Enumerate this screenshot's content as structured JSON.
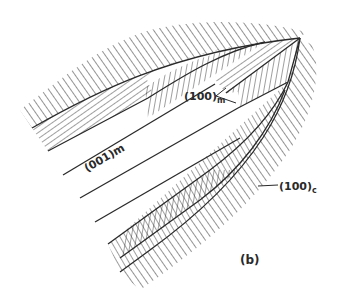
{
  "figure": {
    "panel_label": "(b)",
    "labels": {
      "matrix_100": {
        "main": "(100)",
        "sub": "m"
      },
      "matrix_001": {
        "main": "(001)",
        "sub": "m"
      },
      "cementite_100": {
        "main": "(100)",
        "sub": "c"
      }
    },
    "colors": {
      "line": "#2a2a2a",
      "background": "#ffffff"
    }
  }
}
